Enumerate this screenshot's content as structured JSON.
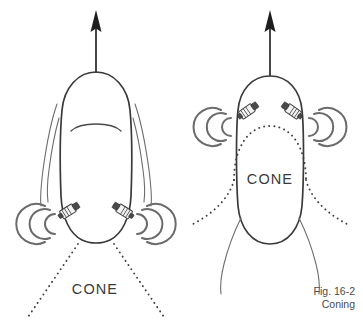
{
  "figure": {
    "caption_line_1": "Fig. 16-2",
    "caption_line_2": "Coning",
    "background_color": "#ffffff",
    "outline_color": "#3a3a3a",
    "dotted_color": "#3d3d3d",
    "wave_color": "#6b6b6b",
    "arrow_color": "#1d1d1d",
    "label_color": "#3b3b3b"
  },
  "panels": [
    {
      "id": "left-panel",
      "name": "coning-below-head",
      "cone_label": "CONE",
      "cone_position": "below-head",
      "arrow_label": "up-arrow",
      "probe_count": 2,
      "wave_group_count": 2
    },
    {
      "id": "right-panel",
      "name": "coning-inside-head",
      "cone_label": "CONE",
      "cone_position": "inside-head",
      "arrow_label": "up-arrow",
      "probe_count": 2,
      "wave_group_count": 2
    }
  ],
  "labels": {
    "cone_left": "CONE",
    "cone_right": "CONE"
  },
  "icons": {
    "arrow_up": "up-arrow-icon",
    "probe": "transducer-probe-icon",
    "waves": "signal-wave-icon"
  }
}
